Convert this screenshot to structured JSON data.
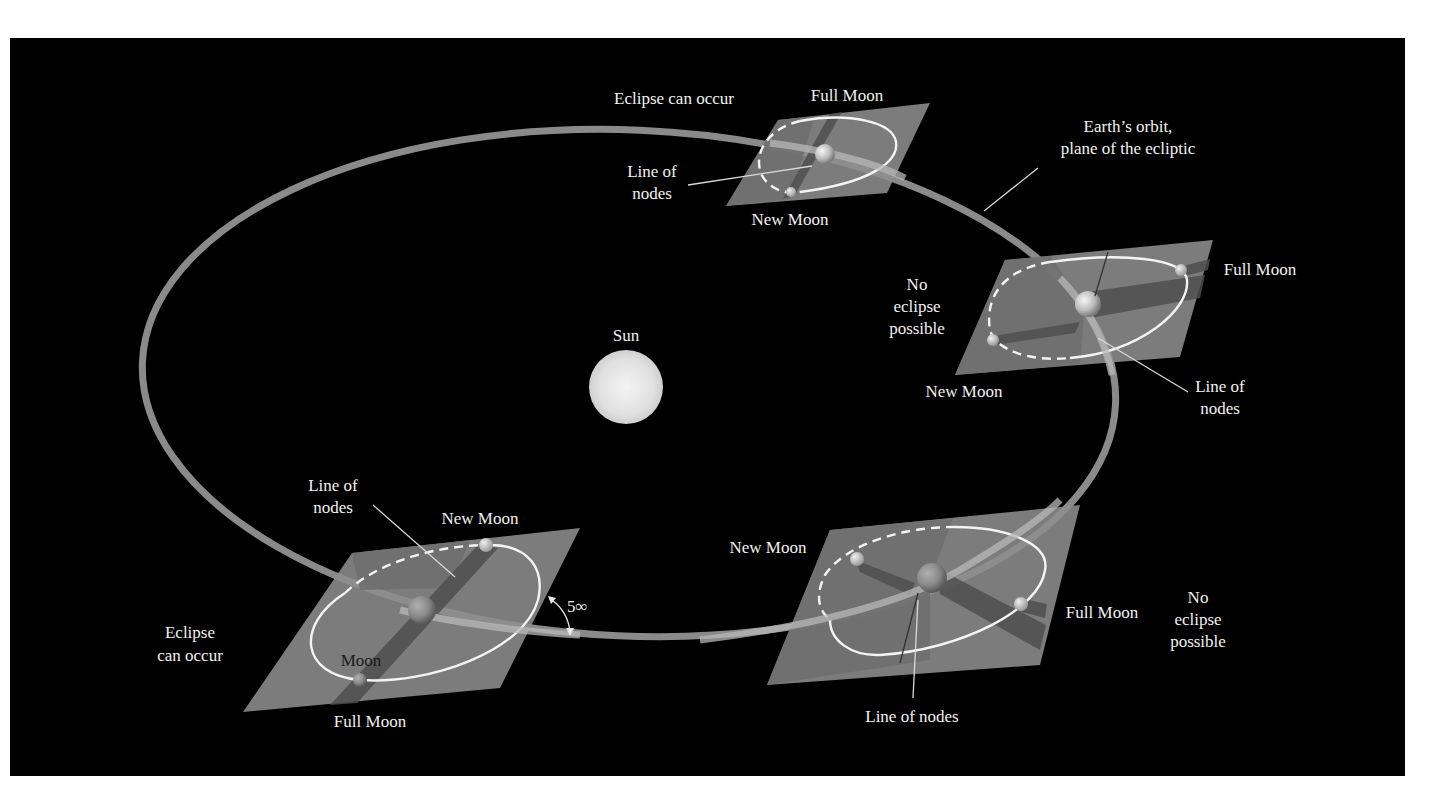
{
  "figure": {
    "colors": {
      "page_background": "#ffffff",
      "panel_background": "#000000",
      "orbit": "#8a8a8a",
      "plane": "#8d8d8d",
      "sun": "#e6e6e6",
      "text": "#f2f2f2"
    }
  },
  "labels": {
    "sun": "Sun",
    "earth_orbit_line1": "Earth’s orbit,",
    "earth_orbit_line2": "plane of the ecliptic",
    "angle": "5∞",
    "moon": "Moon"
  },
  "positions": {
    "top": {
      "condition": "Eclipse can occur",
      "full_moon": "Full Moon",
      "new_moon": "New Moon",
      "line_of_nodes_1": "Line of",
      "line_of_nodes_2": "nodes"
    },
    "right": {
      "condition_1": "No",
      "condition_2": "eclipse",
      "condition_3": "possible",
      "full_moon": "Full Moon",
      "new_moon": "New Moon",
      "line_of_nodes_1": "Line of",
      "line_of_nodes_2": "nodes"
    },
    "bottom_left": {
      "condition_1": "Eclipse",
      "condition_2": "can occur",
      "full_moon": "Full Moon",
      "new_moon": "New Moon",
      "line_of_nodes_1": "Line of",
      "line_of_nodes_2": "nodes"
    },
    "bottom_right": {
      "condition_1": "No",
      "condition_2": "eclipse",
      "condition_3": "possible",
      "full_moon": "Full Moon",
      "new_moon": "New Moon",
      "line_of_nodes": "Line of nodes"
    }
  }
}
